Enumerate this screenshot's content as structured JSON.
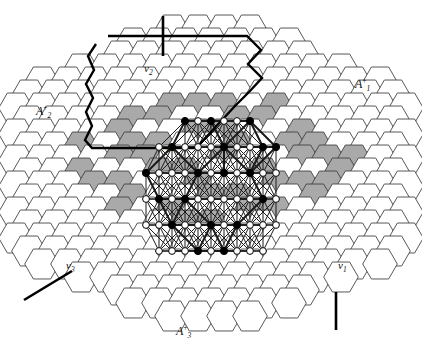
{
  "figure": {
    "background": "#ffffff",
    "width": 422,
    "height": 350
  },
  "colors": {
    "hex_stroke": "#3a3a3a",
    "hex_fill_plain": "#ffffff",
    "hex_fill_shaded": "#a9a9a9",
    "lattice_stroke": "#1a1a1a",
    "boundary_stroke": "#000000",
    "node_filled": "#000000",
    "node_hollow": "#ffffff",
    "node_stroke": "#000000",
    "text": "#111111"
  },
  "geometry": {
    "hex_circumradius": 17.3,
    "hex_width": 30.0,
    "hex_vstep": 26.0,
    "hex_hstep": 26.0,
    "origin_x": 211,
    "origin_y": 173,
    "node_radius_filled": 3.6,
    "node_radius_hollow": 3.4,
    "lattice_step": 52.0
  },
  "labels": [
    {
      "name": "label-A1-plus",
      "base": "A",
      "sub": "1",
      "sup": "+",
      "x": 355,
      "y": 77,
      "size": "big"
    },
    {
      "name": "label-A2-plus",
      "base": "A",
      "sub": "2",
      "sup": "+",
      "x": 36,
      "y": 104,
      "size": "big"
    },
    {
      "name": "label-A3-plus",
      "base": "A",
      "sub": "3",
      "sup": "+",
      "x": 176,
      "y": 324,
      "size": "big"
    },
    {
      "name": "label-v1",
      "base": "v",
      "sub": "1",
      "sup": "",
      "x": 338,
      "y": 260,
      "size": "small"
    },
    {
      "name": "label-v2",
      "base": "v",
      "sub": "2",
      "sup": "",
      "x": 144,
      "y": 63,
      "size": "small"
    },
    {
      "name": "label-v3",
      "base": "v",
      "sub": "3",
      "sup": "",
      "x": 66,
      "y": 260,
      "size": "small"
    },
    {
      "name": "label-z",
      "base": "z",
      "sub": "",
      "sup": "",
      "x": 166,
      "y": 143,
      "size": "small"
    }
  ],
  "shaded_cells": [
    [
      -1,
      -5
    ],
    [
      0,
      -5
    ],
    [
      -3,
      -4
    ],
    [
      -2,
      -4
    ],
    [
      1,
      -4
    ],
    [
      2,
      -4
    ],
    [
      -4,
      -3
    ],
    [
      -1,
      -3
    ],
    [
      0,
      -3
    ],
    [
      3,
      -3
    ],
    [
      -5,
      -2
    ],
    [
      -2,
      -2
    ],
    [
      1,
      -2
    ],
    [
      4,
      -2
    ],
    [
      -4,
      -1
    ],
    [
      -3,
      -1
    ],
    [
      0,
      -1
    ],
    [
      3,
      -1
    ],
    [
      4,
      -1
    ],
    [
      -5,
      0
    ],
    [
      -2,
      0
    ],
    [
      -1,
      0
    ],
    [
      2,
      0
    ],
    [
      5,
      0
    ],
    [
      -4,
      1
    ],
    [
      -1,
      1
    ],
    [
      2,
      1
    ],
    [
      3,
      1
    ],
    [
      -3,
      2
    ],
    [
      0,
      2
    ],
    [
      1,
      2
    ],
    [
      4,
      2
    ],
    [
      -2,
      3
    ],
    [
      1,
      3
    ],
    [
      2,
      3
    ],
    [
      -1,
      4
    ],
    [
      0,
      4
    ],
    [
      -3,
      -2
    ],
    [
      3,
      -2
    ],
    [
      -5,
      1
    ],
    [
      5,
      -1
    ],
    [
      -4,
      3
    ],
    [
      4,
      1
    ],
    [
      -2,
      -5
    ],
    [
      2,
      -5
    ]
  ],
  "lattice_nodes_filled": [
    [
      -2,
      -4
    ],
    [
      0,
      -4
    ],
    [
      3,
      -4
    ],
    [
      -3,
      -2
    ],
    [
      1,
      -2
    ],
    [
      4,
      -2
    ],
    [
      5,
      -2
    ],
    [
      -1,
      0
    ],
    [
      1,
      0
    ],
    [
      3,
      0
    ],
    [
      -4,
      2
    ],
    [
      -2,
      2
    ],
    [
      4,
      2
    ],
    [
      -3,
      4
    ],
    [
      0,
      4
    ],
    [
      2,
      4
    ],
    [
      -1,
      6
    ],
    [
      1,
      6
    ],
    [
      -5,
      0
    ]
  ],
  "lattice_nodes_hollow": [
    [
      -1,
      -4
    ],
    [
      1,
      -4
    ],
    [
      2,
      -4
    ],
    [
      -4,
      -2
    ],
    [
      -2,
      -2
    ],
    [
      -1,
      -2
    ],
    [
      0,
      -2
    ],
    [
      2,
      -2
    ],
    [
      3,
      -2
    ],
    [
      -4,
      0
    ],
    [
      -3,
      0
    ],
    [
      -2,
      0
    ],
    [
      0,
      0
    ],
    [
      2,
      0
    ],
    [
      4,
      0
    ],
    [
      5,
      0
    ],
    [
      -5,
      2
    ],
    [
      -3,
      2
    ],
    [
      -1,
      2
    ],
    [
      0,
      2
    ],
    [
      1,
      2
    ],
    [
      2,
      2
    ],
    [
      3,
      2
    ],
    [
      5,
      2
    ],
    [
      -5,
      4
    ],
    [
      -4,
      4
    ],
    [
      -2,
      4
    ],
    [
      -1,
      4
    ],
    [
      1,
      4
    ],
    [
      3,
      4
    ],
    [
      4,
      4
    ],
    [
      5,
      4
    ],
    [
      -4,
      6
    ],
    [
      -3,
      6
    ],
    [
      -2,
      6
    ],
    [
      0,
      6
    ],
    [
      2,
      6
    ],
    [
      3,
      6
    ],
    [
      4,
      6
    ]
  ],
  "boundary_polygon": {
    "name": "fundamental-domain-boundary",
    "points": "106,34 248,34 250,34 262,48 248,62 262,76 250,90 264,104 250,118 224,118 196,118 168,118 140,118 126,132 112,118 98,118 84,104 98,90 84,76 98,62 92,48",
    "closed": true
  },
  "boundary_path": [
    [
      107,
      36
    ],
    [
      240,
      36
    ],
    [
      249,
      36
    ],
    [
      249,
      37
    ],
    [
      263,
      53
    ],
    [
      249,
      70
    ],
    [
      252,
      73
    ],
    [
      249,
      76
    ],
    [
      238,
      88
    ],
    [
      225,
      104
    ],
    [
      212,
      104
    ],
    [
      198,
      104
    ],
    [
      185,
      104
    ],
    [
      172,
      104
    ],
    [
      159,
      104
    ],
    [
      146,
      104
    ],
    [
      133,
      104
    ],
    [
      120,
      104
    ],
    [
      107,
      104
    ]
  ],
  "tick_marks": [
    {
      "name": "tick-top",
      "x1": 163,
      "y1": 16,
      "x2": 163,
      "y2": 56,
      "width": 2.6
    },
    {
      "name": "tick-bottom-right",
      "x1": 336,
      "y1": 292,
      "x2": 336,
      "y2": 330,
      "width": 2.6
    },
    {
      "name": "tick-bottom-left",
      "x1": 24,
      "y1": 300,
      "x2": 72,
      "y2": 271,
      "width": 2.6
    }
  ],
  "axes": {
    "A1_plus": "A₁⁺",
    "A2_plus": "A₂⁺",
    "A3_plus": "A₃⁺"
  },
  "vertices": {
    "v1": "v₁",
    "v2": "v₂",
    "v3": "v₃",
    "z": "z"
  }
}
